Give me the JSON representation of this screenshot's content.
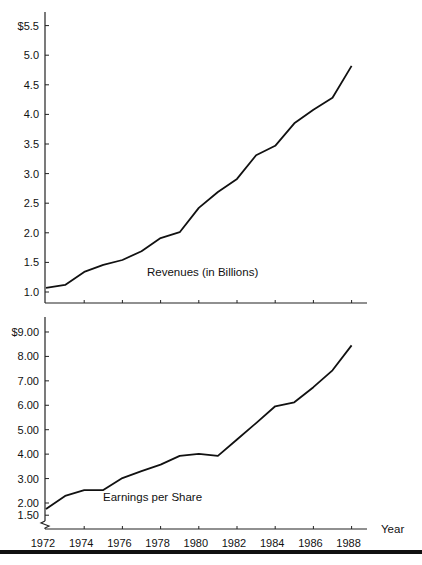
{
  "chart_data": [
    {
      "type": "line",
      "title": "Revenues (in Billions)",
      "xlabel": "Year",
      "ylabel": "",
      "ylim": [
        1.0,
        5.5
      ],
      "ytick_labels": [
        "1.0",
        "1.5",
        "2.0",
        "2.5",
        "3.0",
        "3.5",
        "4.0",
        "4.5",
        "5.0",
        "$5.5"
      ],
      "yticks": [
        1.0,
        1.5,
        2.0,
        2.5,
        3.0,
        3.5,
        4.0,
        4.5,
        5.0,
        5.5
      ],
      "x": [
        1972,
        1973,
        1974,
        1975,
        1976,
        1977,
        1978,
        1979,
        1980,
        1981,
        1982,
        1983,
        1984,
        1985,
        1986,
        1987,
        1988
      ],
      "series": [
        {
          "name": "Revenues (in Billions)",
          "values": [
            1.07,
            1.12,
            1.34,
            1.46,
            1.54,
            1.69,
            1.91,
            2.01,
            2.42,
            2.69,
            2.91,
            3.31,
            3.47,
            3.85,
            4.08,
            4.28,
            4.82
          ]
        }
      ],
      "grid": false
    },
    {
      "type": "line",
      "title": "Earnings per Share",
      "xlabel": "Year",
      "ylabel": "",
      "ylim": [
        1.5,
        9.0
      ],
      "ytick_labels": [
        "1.50",
        "2.00",
        "3.00",
        "4.00",
        "5.00",
        "6.00",
        "7.00",
        "8.00",
        "$9.00"
      ],
      "yticks": [
        1.5,
        2.0,
        3.0,
        4.0,
        5.0,
        6.0,
        7.0,
        8.0,
        9.0
      ],
      "x": [
        1972,
        1973,
        1974,
        1975,
        1976,
        1977,
        1978,
        1979,
        1980,
        1981,
        1982,
        1983,
        1984,
        1985,
        1986,
        1987,
        1988
      ],
      "xtick_labels": [
        "1972",
        "1974",
        "1976",
        "1978",
        "1980",
        "1982",
        "1984",
        "1986",
        "1988"
      ],
      "series": [
        {
          "name": "Earnings per Share",
          "values": [
            1.75,
            2.29,
            2.53,
            2.53,
            3.02,
            3.3,
            3.57,
            3.93,
            4.01,
            3.93,
            4.6,
            5.27,
            5.96,
            6.12,
            6.74,
            7.43,
            8.45
          ]
        }
      ],
      "axis_break": true,
      "grid": false
    }
  ],
  "labels": {
    "x_axis_title": "Year",
    "top_series_label": "Revenues (in Billions)",
    "bottom_series_label": "Earnings per Share"
  }
}
